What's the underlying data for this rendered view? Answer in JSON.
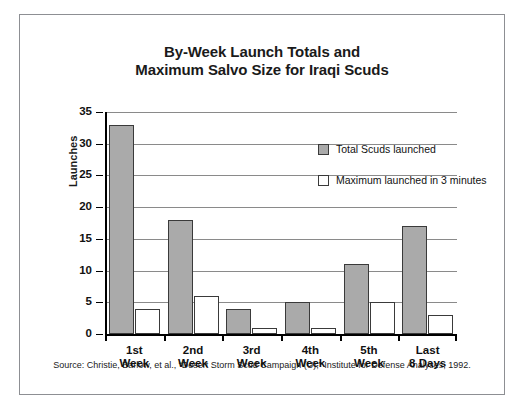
{
  "chart_data": {
    "type": "bar",
    "title": "By-Week Launch Totals and Maximum Salvo Size for Iraqi Scuds",
    "title_line1": "By-Week Launch Totals and",
    "title_line2": "Maximum Salvo Size for Iraqi Scuds",
    "xlabel": "",
    "ylabel": "Launches",
    "ylim": [
      0,
      35
    ],
    "ytick_step": 5,
    "yticks": [
      "0",
      "5",
      "10",
      "15",
      "20",
      "25",
      "30",
      "35"
    ],
    "grid": true,
    "legend_position": "upper-right-inside",
    "categories": [
      "1st Week",
      "2nd Week",
      "3rd Week",
      "4th Week",
      "5th Week",
      "Last 8 Days"
    ],
    "category_lines": [
      [
        "1st",
        "Week"
      ],
      [
        "2nd",
        "Week"
      ],
      [
        "3rd",
        "Week"
      ],
      [
        "4th",
        "Week"
      ],
      [
        "5th",
        "Week"
      ],
      [
        "Last",
        "8 Days"
      ]
    ],
    "series": [
      {
        "name": "Total Scuds launched",
        "color": "#aaaaaa",
        "values": [
          33,
          18,
          4,
          5,
          11,
          17
        ]
      },
      {
        "name": "Maximum launched in 3 minutes",
        "color": "#ffffff",
        "values": [
          4,
          6,
          1,
          1,
          5,
          3
        ]
      }
    ],
    "source": "Source: Christie, Barlow, et al., “Desert Storm Scud Campaign (U),” Institute for Defense Analyses, 1992."
  }
}
